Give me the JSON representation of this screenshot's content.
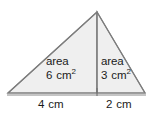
{
  "figure": {
    "kind": "geometry-diagram",
    "shape": "triangle-split-into-two-triangles",
    "colors": {
      "background": "#ffffff",
      "fill": "#efefef",
      "stroke": "#808080",
      "divider": "#7a7a7a",
      "baseline": "#8a8a8a",
      "text": "#1a1a1a"
    },
    "geometry": {
      "apex": [
        97,
        12
      ],
      "left_vertex": [
        8,
        93
      ],
      "right_vertex": [
        145,
        93
      ],
      "divider_x": 97,
      "baseline_y": 95
    },
    "regions": {
      "left": {
        "area_word": "area",
        "area_number": "6",
        "area_unit": "cm",
        "area_exponent": "2",
        "base_label_number": "4",
        "base_label_unit": "cm"
      },
      "right": {
        "area_word": "area",
        "area_number": "3",
        "area_unit": "cm",
        "area_exponent": "2",
        "base_label_number": "2",
        "base_label_unit": "cm"
      }
    }
  }
}
